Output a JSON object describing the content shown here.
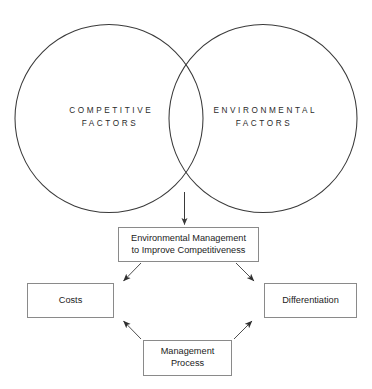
{
  "diagram": {
    "title": "Environmental Management to Improve Competitiveness",
    "stroke_color": "#3a3a3a",
    "box_border_color": "#8a8a8a",
    "text_color": "#1c1c1c",
    "background_color": "#ffffff",
    "venn": {
      "left_circle": {
        "label": "COMPETITIVE\nFACTORS",
        "line1": "COMPETITIVE",
        "line2": "FACTORS"
      },
      "right_circle": {
        "label": "ENVIRONMENTAL\nFACTORS",
        "line1": "ENVIRONMENTAL",
        "line2": "FACTORS"
      }
    },
    "boxes": {
      "core": {
        "label": "Environmental Management\nto Improve Competitiveness",
        "line1": "Environmental Management",
        "line2": "to Improve Competitiveness"
      },
      "costs": {
        "label": "Costs"
      },
      "differentiation": {
        "label": "Differentiation"
      },
      "management_process": {
        "label": "Management\nProcess",
        "line1": "Management",
        "line2": "Process"
      }
    },
    "connectors": [
      {
        "name": "venn-to-core",
        "from": "venn-overlap",
        "to": "core",
        "style": "solid-arrow-down"
      },
      {
        "name": "core-to-costs",
        "from": "core",
        "to": "costs",
        "style": "thin-arrow-diagonal"
      },
      {
        "name": "core-to-differentiation",
        "from": "core",
        "to": "differentiation",
        "style": "thin-arrow-diagonal"
      },
      {
        "name": "management-process-to-costs",
        "from": "management_process",
        "to": "costs",
        "style": "thin-arrow-diagonal"
      },
      {
        "name": "management-process-to-differentiation",
        "from": "management_process",
        "to": "differentiation",
        "style": "thin-arrow-diagonal"
      }
    ]
  }
}
